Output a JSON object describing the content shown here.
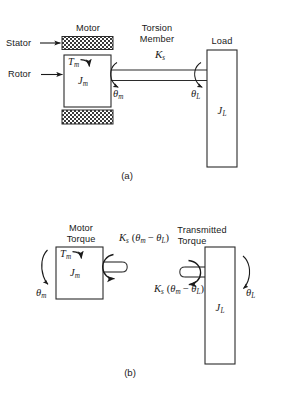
{
  "figure": {
    "title_panels": [
      "(a)",
      "(b)"
    ]
  },
  "panel_a": {
    "caption": "(a)",
    "labels": {
      "stator": "Stator",
      "rotor": "Rotor",
      "motor": "Motor",
      "torsion_member_line1": "Torsion",
      "torsion_member_line2": "Member",
      "load": "Load"
    },
    "symbols": {
      "motor_torque": "T",
      "motor_torque_sub": "m",
      "motor_inertia": "J",
      "motor_inertia_sub": "m",
      "spring_constant": "K",
      "spring_constant_sub": "s",
      "theta_motor": "θ",
      "theta_motor_sub": "m",
      "theta_load": "θ",
      "theta_load_sub": "L",
      "load_inertia": "J",
      "load_inertia_sub": "L"
    }
  },
  "panel_b": {
    "caption": "(b)",
    "labels": {
      "motor_torque_line1": "Motor",
      "motor_torque_line2": "Torque",
      "transmitted_torque_line1": "Transmitted",
      "transmitted_torque_line2": "Torque"
    },
    "symbols": {
      "motor_torque": "T",
      "motor_torque_sub": "m",
      "motor_inertia": "J",
      "motor_inertia_sub": "m",
      "theta_motor": "θ",
      "theta_motor_sub": "m",
      "theta_load": "θ",
      "theta_load_sub": "L",
      "load_inertia": "J",
      "load_inertia_sub": "L",
      "spring_torque_k": "K",
      "spring_torque_k_sub": "s",
      "spring_torque_expr_open": "(",
      "spring_torque_theta_m": "θ",
      "spring_torque_theta_m_sub": "m",
      "spring_torque_minus": "−",
      "spring_torque_theta_l": "θ",
      "spring_torque_theta_l_sub": "L",
      "spring_torque_expr_close": ")"
    }
  },
  "colors": {
    "stroke": "#2b2b2b",
    "fill": "#ffffff",
    "hatch": "#3a3a3a",
    "text": "#1a1a1a",
    "background": "#ffffff"
  }
}
